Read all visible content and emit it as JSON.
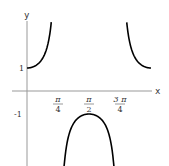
{
  "chart_data": {
    "type": "line",
    "title": "",
    "function": "sec(2x)",
    "xlabel": "x",
    "ylabel": "y",
    "xlim": [
      0,
      3.14159
    ],
    "ylim": [
      -3.3,
      3.0
    ],
    "grid": false,
    "legend": null,
    "x_ticks": [
      {
        "value": 0.7854,
        "num": "π",
        "den": "4"
      },
      {
        "value": 1.5708,
        "num": "π",
        "den": "2"
      },
      {
        "value": 2.3562,
        "num": "3 π",
        "den": "4"
      }
    ],
    "y_ticks": [
      {
        "value": 1,
        "label": "1"
      },
      {
        "value": -1,
        "label": "-1"
      }
    ],
    "series": [
      {
        "name": "branch-left",
        "x_range": [
          0,
          0.615
        ],
        "points": [
          [
            0,
            1
          ],
          [
            0.2,
            1.086
          ],
          [
            0.4,
            1.435
          ],
          [
            0.5,
            1.851
          ],
          [
            0.6,
            2.762
          ],
          [
            0.615,
            3.0
          ]
        ]
      },
      {
        "name": "branch-middle",
        "x_range": [
          0.934,
          2.207
        ],
        "points": [
          [
            0.95,
            -3.07
          ],
          [
            1.1,
            -1.7
          ],
          [
            1.3,
            -1.17
          ],
          [
            1.5708,
            -1.0
          ],
          [
            1.84,
            -1.17
          ],
          [
            2.04,
            -1.7
          ],
          [
            2.19,
            -3.07
          ]
        ]
      },
      {
        "name": "branch-right",
        "x_range": [
          2.527,
          3.14159
        ],
        "points": [
          [
            2.527,
            3.0
          ],
          [
            2.6,
            2.21
          ],
          [
            2.8,
            1.3
          ],
          [
            3.0,
            1.04
          ],
          [
            3.14159,
            1.0
          ]
        ]
      }
    ],
    "line_color": "#000000",
    "axis_color": "#999999"
  },
  "labels": {
    "x_axis": "x",
    "y_axis": "y",
    "y_one": "1",
    "y_minus_one": "-1"
  }
}
